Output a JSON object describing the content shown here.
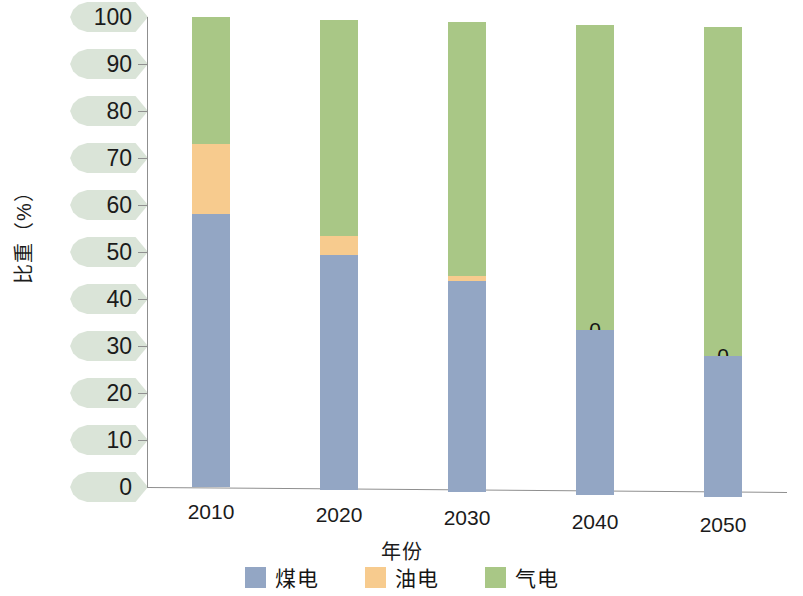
{
  "chart_data": {
    "type": "bar",
    "subtype": "stacked-bar-100",
    "title": "",
    "xlabel": "年份",
    "ylabel": "比重（%）",
    "categories": [
      "2010",
      "2020",
      "2030",
      "2040",
      "2050"
    ],
    "ylim": [
      0,
      100
    ],
    "yticks": [
      "0",
      "10",
      "20",
      "30",
      "40",
      "50",
      "60",
      "70",
      "80",
      "90",
      "100"
    ],
    "grid": false,
    "legend_position": "bottom",
    "series": [
      {
        "name": "煤电",
        "color": "#93a6c4",
        "values": [
          58,
          50,
          45,
          35,
          30
        ],
        "labels": [
          "58%",
          "50%",
          "45%",
          "35%",
          "30%"
        ]
      },
      {
        "name": "油电",
        "color": "#f7cb8e",
        "values": [
          15,
          4,
          1,
          0,
          0
        ],
        "labels": [
          "15%",
          "4%",
          "1%",
          "0",
          "0"
        ]
      },
      {
        "name": "气电",
        "color": "#a9c786",
        "values": [
          27,
          46,
          54,
          65,
          70
        ],
        "labels": [
          "27%",
          "46%",
          "54%",
          "65%",
          "70%"
        ]
      }
    ]
  },
  "axis": {
    "y_title": "比重（%）",
    "x_title": "年份",
    "y_ticks": [
      {
        "value": 100,
        "label": "100"
      },
      {
        "value": 90,
        "label": "90"
      },
      {
        "value": 80,
        "label": "80"
      },
      {
        "value": 70,
        "label": "70"
      },
      {
        "value": 60,
        "label": "60"
      },
      {
        "value": 50,
        "label": "50"
      },
      {
        "value": 40,
        "label": "40"
      },
      {
        "value": 30,
        "label": "30"
      },
      {
        "value": 20,
        "label": "20"
      },
      {
        "value": 10,
        "label": "10"
      },
      {
        "value": 0,
        "label": "0"
      }
    ],
    "x_ticks": [
      "2010",
      "2020",
      "2030",
      "2040",
      "2050"
    ]
  },
  "legend": {
    "items": [
      {
        "label": "煤电",
        "color": "#93a6c4"
      },
      {
        "label": "油电",
        "color": "#f7cb8e"
      },
      {
        "label": "气电",
        "color": "#a9c786"
      }
    ]
  },
  "colors": {
    "coal": "#93a6c4",
    "oil": "#f7cb8e",
    "gas": "#a9c786",
    "tick_tag": "#d7e2d5",
    "axis": "#8f8f8f",
    "background": "#ffffff"
  }
}
